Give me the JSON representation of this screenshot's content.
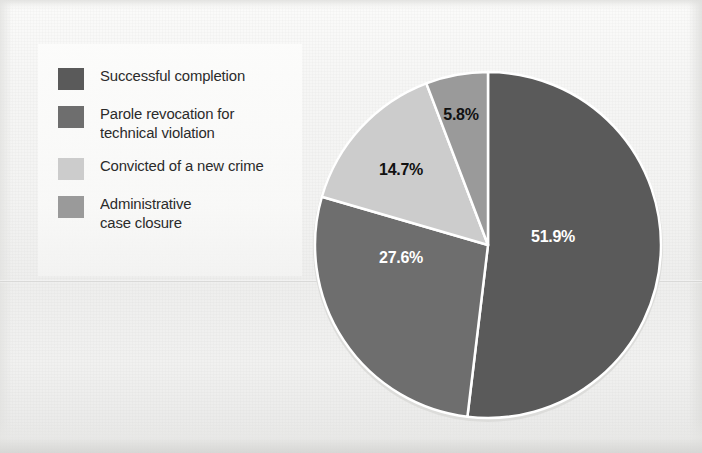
{
  "chart_data": {
    "type": "pie",
    "title": "",
    "categories": [
      "Successful completion",
      "Parole revocation for technical violation",
      "Convicted of a new crime",
      "Administrative case closure"
    ],
    "values": [
      51.9,
      27.6,
      14.7,
      5.8
    ],
    "value_labels": [
      "51.9%",
      "27.6%",
      "14.7%",
      "5.8%"
    ],
    "colors": [
      "#5a5a5a",
      "#6e6e6e",
      "#cccccc",
      "#9a9a9a"
    ],
    "legend_position": "left",
    "start_angle_deg": 0,
    "direction": "clockwise",
    "separator_color": "#ffffff",
    "units": "percent"
  },
  "legend": {
    "items": [
      {
        "label": "Successful completion",
        "color": "#5a5a5a",
        "value_label": "51.9%"
      },
      {
        "label": "Parole revocation for\ntechnical violation",
        "color": "#6e6e6e",
        "value_label": "27.6%"
      },
      {
        "label": "Convicted of a new crime",
        "color": "#cccccc",
        "value_label": "14.7%"
      },
      {
        "label": "Administrative\ncase closure",
        "color": "#9a9a9a",
        "value_label": "5.8%"
      }
    ]
  },
  "pie": {
    "center_x": 488,
    "center_y": 245,
    "radius": 173,
    "labels": [
      {
        "text": "51.9%",
        "x": 553,
        "y": 237,
        "tone": "light"
      },
      {
        "text": "27.6%",
        "x": 401,
        "y": 258,
        "tone": "light"
      },
      {
        "text": "14.7%",
        "x": 401,
        "y": 170,
        "tone": "dark"
      },
      {
        "text": "5.8%",
        "x": 461,
        "y": 115,
        "tone": "dark"
      }
    ]
  },
  "page": {
    "background_color": "#f2f2f1"
  }
}
